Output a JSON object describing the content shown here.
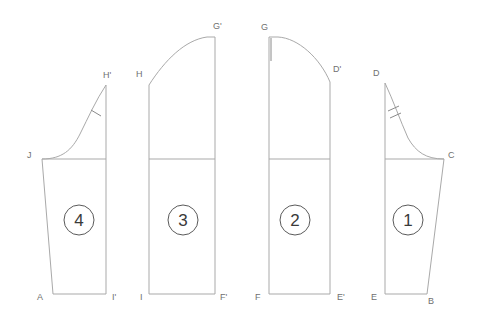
{
  "diagram": {
    "type": "sewing pattern pieces",
    "colors": {
      "outline": "#a9a9a9",
      "label": "#707070",
      "number": "#3a3a3a"
    },
    "pieces": [
      {
        "number": "4",
        "labels": {
          "top_right": "H'",
          "left": "J",
          "bottom_left": "A",
          "bottom_right": "I'"
        },
        "notch": "single"
      },
      {
        "number": "3",
        "labels": {
          "top_left": "H",
          "top_right": "G'",
          "bottom_left": "I",
          "bottom_right": "F'"
        }
      },
      {
        "number": "2",
        "labels": {
          "top_left": "G",
          "top_right": "D'",
          "bottom_left": "F",
          "bottom_right": "E'"
        }
      },
      {
        "number": "1",
        "labels": {
          "top_left": "D",
          "right": "C",
          "bottom_left": "E",
          "bottom_right": "B"
        },
        "notch": "double"
      }
    ]
  }
}
